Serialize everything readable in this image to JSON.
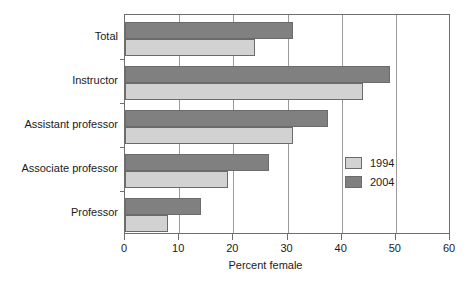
{
  "chart_data": {
    "type": "bar",
    "orientation": "horizontal",
    "title": "",
    "xlabel": "Percent female",
    "ylabel": "",
    "xlim": [
      0,
      60
    ],
    "xticks": [
      0,
      10,
      20,
      30,
      40,
      50,
      60
    ],
    "xticklabels": [
      "0",
      "10",
      "20",
      "30",
      "40",
      "50",
      "60"
    ],
    "grid": "vertical",
    "legend_position": "center-right",
    "categories": [
      "Total",
      "Instructor",
      "Assistant professor",
      "Associate professor",
      "Professor"
    ],
    "series": [
      {
        "name": "1994",
        "color": "#d2d2d2",
        "values": [
          24,
          44,
          31,
          19,
          8
        ]
      },
      {
        "name": "2004",
        "color": "#808080",
        "values": [
          31,
          49,
          37.5,
          26.5,
          14
        ]
      }
    ]
  },
  "legend": {
    "items": [
      {
        "label": "1994"
      },
      {
        "label": "2004"
      }
    ]
  },
  "axis": {
    "x_title": "Percent female"
  }
}
